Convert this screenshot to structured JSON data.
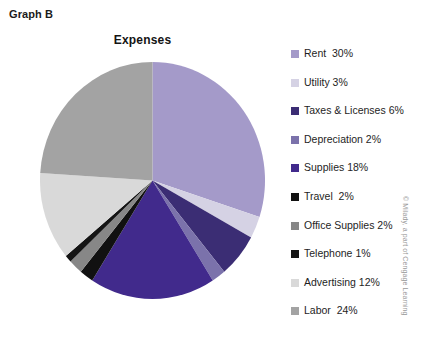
{
  "graph_label": "Graph B",
  "copyright": "© Milady, a part of Cengage Learning",
  "chart_data": {
    "type": "pie",
    "title": "Expenses",
    "xlabel": "",
    "ylabel": "",
    "legend_position": "right",
    "start_angle_deg": 0,
    "direction": "clockwise",
    "categories": [
      "Rent",
      "Utility",
      "Taxes & Licenses",
      "Depreciation",
      "Supplies",
      "Travel",
      "Office Supplies",
      "Telephone",
      "Advertising",
      "Labor"
    ],
    "values": [
      30,
      3,
      6,
      2,
      18,
      2,
      2,
      1,
      12,
      24
    ],
    "unit": "%",
    "colors": [
      "#a49ac9",
      "#d5d2e4",
      "#3b2d74",
      "#7b72ab",
      "#412a8c",
      "#111111",
      "#878787",
      "#141414",
      "#d9d9d9",
      "#a3a3a3"
    ],
    "slices": [
      {
        "label": "Rent",
        "value": 30,
        "color": "#a49ac9",
        "legend_text": "Rent  30%"
      },
      {
        "label": "Utility",
        "value": 3,
        "color": "#d5d2e4",
        "legend_text": "Utility 3%"
      },
      {
        "label": "Taxes & Licenses",
        "value": 6,
        "color": "#3b2d74",
        "legend_text": "Taxes & Licenses 6%"
      },
      {
        "label": "Depreciation",
        "value": 2,
        "color": "#7b72ab",
        "legend_text": "Depreciation 2%"
      },
      {
        "label": "Supplies",
        "value": 18,
        "color": "#412a8c",
        "legend_text": "Supplies 18%"
      },
      {
        "label": "Travel",
        "value": 2,
        "color": "#111111",
        "legend_text": "Travel  2%"
      },
      {
        "label": "Office Supplies",
        "value": 2,
        "color": "#878787",
        "legend_text": "Office Supplies 2%"
      },
      {
        "label": "Telephone",
        "value": 1,
        "color": "#141414",
        "legend_text": "Telephone 1%"
      },
      {
        "label": "Advertising",
        "value": 12,
        "color": "#d9d9d9",
        "legend_text": "Advertising 12%"
      },
      {
        "label": "Labor",
        "value": 24,
        "color": "#a3a3a3",
        "legend_text": "Labor  24%"
      }
    ]
  }
}
